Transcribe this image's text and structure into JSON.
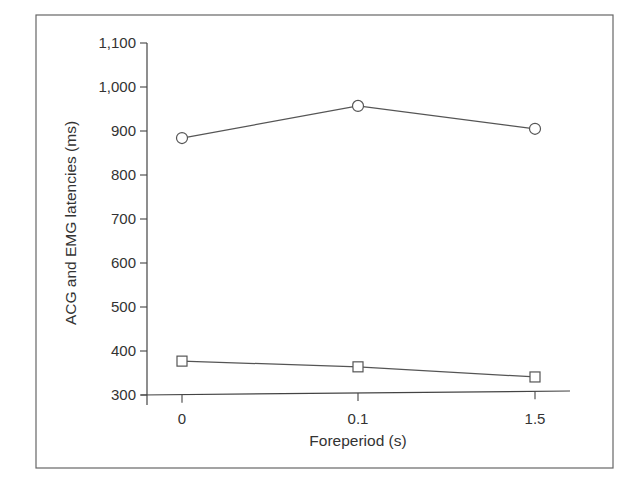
{
  "chart_data": {
    "type": "line",
    "title": "",
    "xlabel": "Foreperiod (s)",
    "ylabel": "ACG and EMG latencies (ms)",
    "categories": [
      "0",
      "0.1",
      "1.5"
    ],
    "ylim": [
      300,
      1100
    ],
    "yticks": [
      300,
      400,
      500,
      600,
      700,
      800,
      900,
      1000,
      1100
    ],
    "ytick_labels": [
      "300",
      "400",
      "500",
      "600",
      "700",
      "800",
      "900",
      "1,000",
      "1,100"
    ],
    "grid": false,
    "legend": "none",
    "series": [
      {
        "name": "circle-series",
        "marker": "circle",
        "values": [
          884,
          957,
          905
        ]
      },
      {
        "name": "square-series",
        "marker": "square",
        "values": [
          377,
          364,
          341
        ]
      }
    ]
  }
}
